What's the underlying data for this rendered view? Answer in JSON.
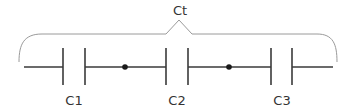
{
  "diagram": {
    "total_label": "Ct",
    "capacitors": [
      {
        "id": "c1",
        "label": "C1"
      },
      {
        "id": "c2",
        "label": "C2"
      },
      {
        "id": "c3",
        "label": "C3"
      }
    ],
    "junction_nodes": 2,
    "colors": {
      "wire": "#3a3a3a",
      "bracket": "#9a9a9a",
      "text": "#333333",
      "node": "#1a1a1a"
    }
  }
}
